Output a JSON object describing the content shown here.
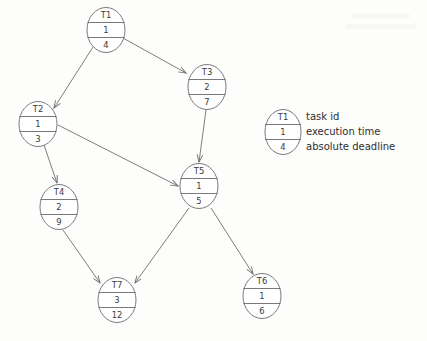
{
  "diagram": {
    "stroke_color": "#6a6a6a",
    "text_color": "#3a3a3a",
    "background_color": "#fdfdfc",
    "nodes": [
      {
        "key": "T1",
        "task_id": "T1",
        "execution_time": "1",
        "absolute_deadline": "4",
        "cx": 106,
        "cy": 30
      },
      {
        "key": "T2",
        "task_id": "T2",
        "execution_time": "1",
        "absolute_deadline": "3",
        "cx": 38,
        "cy": 124
      },
      {
        "key": "T3",
        "task_id": "T3",
        "execution_time": "2",
        "absolute_deadline": "7",
        "cx": 207,
        "cy": 87
      },
      {
        "key": "T4",
        "task_id": "T4",
        "execution_time": "2",
        "absolute_deadline": "9",
        "cx": 59,
        "cy": 207
      },
      {
        "key": "T5",
        "task_id": "T5",
        "execution_time": "1",
        "absolute_deadline": "5",
        "cx": 199,
        "cy": 186
      },
      {
        "key": "T6",
        "task_id": "T6",
        "execution_time": "1",
        "absolute_deadline": "6",
        "cx": 262,
        "cy": 296
      },
      {
        "key": "T7",
        "task_id": "T7",
        "execution_time": "3",
        "absolute_deadline": "12",
        "cx": 117,
        "cy": 300
      }
    ],
    "edges": [
      {
        "from": "T1",
        "to": "T2"
      },
      {
        "from": "T1",
        "to": "T3"
      },
      {
        "from": "T2",
        "to": "T4"
      },
      {
        "from": "T2",
        "to": "T5"
      },
      {
        "from": "T3",
        "to": "T5"
      },
      {
        "from": "T4",
        "to": "T7"
      },
      {
        "from": "T5",
        "to": "T7"
      },
      {
        "from": "T5",
        "to": "T6"
      }
    ]
  },
  "legend": {
    "sample_node": {
      "task_id": "T1",
      "execution_time": "1",
      "absolute_deadline": "4"
    },
    "labels": {
      "task_id": "task id",
      "execution_time": "execution time",
      "absolute_deadline": "absolute deadline"
    }
  }
}
